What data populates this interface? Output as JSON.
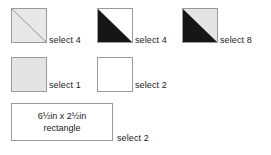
{
  "page": {
    "background_color": "#ffffff",
    "text_color": "#1a1a1a",
    "outline_color": "#9a9a9a",
    "fabric_light_gray": "#e4e4e4",
    "fabric_black": "#161616",
    "fabric_white": "#ffffff"
  },
  "pieces": [
    {
      "id": "hst-gray",
      "shape": "square",
      "icon": "half-square-triangle-gray-gray-icon",
      "fill_upper_right": "#e8e8e8",
      "fill_lower_left": "#e8e8e8",
      "diagonal": true,
      "label": "select 4"
    },
    {
      "id": "hst-black-white",
      "shape": "square",
      "icon": "half-square-triangle-black-white-icon",
      "fill_upper_right": "#ffffff",
      "fill_lower_left": "#161616",
      "diagonal": true,
      "label": "select 4"
    },
    {
      "id": "hst-black-gray",
      "shape": "square",
      "icon": "half-square-triangle-black-gray-icon",
      "fill_upper_right": "#e4e4e4",
      "fill_lower_left": "#161616",
      "diagonal": true,
      "label": "select 8"
    },
    {
      "id": "solid-gray",
      "shape": "square",
      "icon": "solid-square-gray-icon",
      "fill": "#e4e4e4",
      "diagonal": false,
      "label": "select 1"
    },
    {
      "id": "solid-white",
      "shape": "square",
      "icon": "solid-square-white-icon",
      "fill": "#ffffff",
      "diagonal": false,
      "label": "select 2"
    },
    {
      "id": "rectangle",
      "shape": "rectangle",
      "icon": "rectangle-outline-icon",
      "fill": "#ffffff",
      "text_line_1": "6½in x 2½in",
      "text_line_2": "rectangle",
      "label": "select 2"
    }
  ]
}
